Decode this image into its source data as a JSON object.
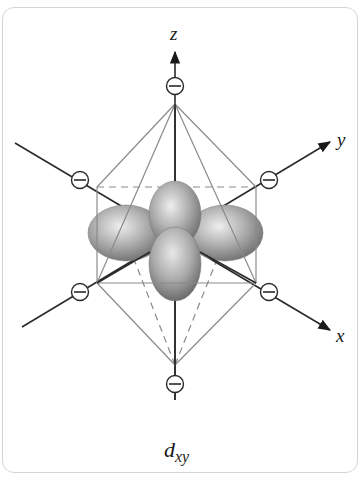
{
  "figure": {
    "orbital_label_main": "d",
    "orbital_label_sub": "xy",
    "axes": {
      "z": "z",
      "y": "y",
      "x": "x"
    },
    "ligand_charge_symbol": "−",
    "ligand_count": 6,
    "geometry": "octahedral",
    "colors": {
      "frame_border": "#d4d4d4",
      "axis_line": "#2a2a2a",
      "edge_line": "#8a8a8a",
      "lobe_light": "#e6e6e6",
      "lobe_dark": "#6e6e6e"
    }
  }
}
